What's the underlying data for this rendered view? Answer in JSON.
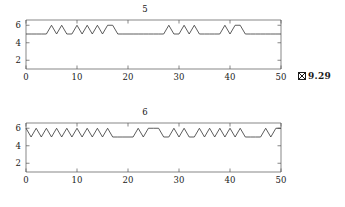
{
  "figures": [
    {
      "id": "fig-9-29",
      "caption_prefix": "図",
      "caption": "9.29",
      "chart_data": {
        "type": "line",
        "title": "5",
        "xlabel": "",
        "ylabel": "",
        "xlim": [
          0,
          50
        ],
        "ylim": [
          1,
          6.6
        ],
        "xticks": [
          0,
          10,
          20,
          30,
          40,
          50
        ],
        "xticklabels": [
          "0",
          "10",
          "20",
          "30",
          "40",
          "50"
        ],
        "yticks": [
          2,
          4,
          6
        ],
        "yticklabels": [
          "2",
          "4",
          "6"
        ],
        "grid": false,
        "legend": false,
        "drawstyle": "linear",
        "baseline": 5,
        "peak": 6,
        "x": [
          0,
          1,
          2,
          3,
          4,
          5,
          6,
          7,
          8,
          9,
          10,
          11,
          12,
          13,
          14,
          15,
          16,
          17,
          18,
          19,
          20,
          21,
          22,
          23,
          24,
          25,
          26,
          27,
          28,
          29,
          30,
          31,
          32,
          33,
          34,
          35,
          36,
          37,
          38,
          39,
          40,
          41,
          42,
          43,
          44,
          45,
          46,
          47,
          48,
          49,
          50
        ],
        "y": [
          5,
          5,
          5,
          5,
          5,
          6,
          5,
          6,
          5,
          5,
          6,
          5,
          6,
          5,
          6,
          5,
          6,
          6,
          5,
          5,
          5,
          5,
          5,
          5,
          5,
          5,
          5,
          5,
          6,
          5,
          5,
          6,
          5,
          6,
          5,
          5,
          5,
          5,
          5,
          6,
          5,
          6,
          6,
          5,
          5,
          5,
          5,
          5,
          5,
          5,
          5
        ]
      }
    },
    {
      "id": "fig-9-30",
      "caption_prefix": "図",
      "caption": "9.30",
      "chart_data": {
        "type": "line",
        "title": "6",
        "xlabel": "",
        "ylabel": "",
        "xlim": [
          0,
          50
        ],
        "ylim": [
          1,
          6.6
        ],
        "xticks": [
          0,
          10,
          20,
          30,
          40,
          50
        ],
        "xticklabels": [
          "0",
          "10",
          "20",
          "30",
          "40",
          "50"
        ],
        "yticks": [
          2,
          4,
          6
        ],
        "yticklabels": [
          "2",
          "4",
          "6"
        ],
        "grid": false,
        "legend": false,
        "drawstyle": "linear",
        "baseline": 5,
        "peak": 6,
        "x": [
          0,
          1,
          2,
          3,
          4,
          5,
          6,
          7,
          8,
          9,
          10,
          11,
          12,
          13,
          14,
          15,
          16,
          17,
          18,
          19,
          20,
          21,
          22,
          23,
          24,
          25,
          26,
          27,
          28,
          29,
          30,
          31,
          32,
          33,
          34,
          35,
          36,
          37,
          38,
          39,
          40,
          41,
          42,
          43,
          44,
          45,
          46,
          47,
          48,
          49,
          50
        ],
        "y": [
          6,
          5,
          6,
          5,
          6,
          5,
          6,
          5,
          6,
          5,
          6,
          5,
          6,
          5,
          6,
          5,
          6,
          5,
          5,
          5,
          5,
          5,
          6,
          5,
          6,
          6,
          6,
          5,
          5,
          6,
          5,
          6,
          5,
          5,
          6,
          5,
          6,
          5,
          6,
          5,
          6,
          5,
          6,
          5,
          5,
          5,
          5,
          6,
          5,
          6,
          6
        ]
      }
    }
  ]
}
